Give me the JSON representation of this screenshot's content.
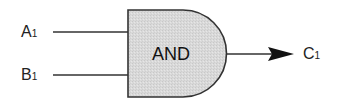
{
  "diagram": {
    "type": "logic-gate",
    "gate": {
      "kind": "AND",
      "label": "AND",
      "fill": "#d8d8d8",
      "stroke": "#333333"
    },
    "inputs": [
      {
        "name": "A",
        "subscript": "1"
      },
      {
        "name": "B",
        "subscript": "1"
      }
    ],
    "output": {
      "name": "C",
      "subscript": "1"
    },
    "colors": {
      "line": "#333333",
      "text": "#222222",
      "background": "#ffffff"
    }
  }
}
